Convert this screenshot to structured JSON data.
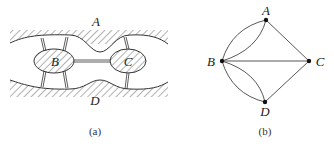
{
  "figure_a": {
    "caption": "(a)",
    "regions": {
      "top_bank": "A",
      "left_island": "B",
      "right_island": "C",
      "bottom_bank": "D"
    },
    "bridges": [
      {
        "from": "A",
        "to": "B",
        "count": 2
      },
      {
        "from": "D",
        "to": "B",
        "count": 2
      },
      {
        "from": "B",
        "to": "C",
        "count": 1
      },
      {
        "from": "A",
        "to": "C",
        "count": 1
      },
      {
        "from": "D",
        "to": "C",
        "count": 1
      }
    ]
  },
  "figure_b": {
    "caption": "(b)",
    "nodes": [
      {
        "id": "A",
        "label": "A"
      },
      {
        "id": "B",
        "label": "B"
      },
      {
        "id": "C",
        "label": "C"
      },
      {
        "id": "D",
        "label": "D"
      }
    ],
    "edges": [
      {
        "from": "B",
        "to": "A",
        "count": 2
      },
      {
        "from": "B",
        "to": "D",
        "count": 2
      },
      {
        "from": "B",
        "to": "C",
        "count": 1
      },
      {
        "from": "A",
        "to": "C",
        "count": 1
      },
      {
        "from": "D",
        "to": "C",
        "count": 1
      }
    ]
  },
  "colors": {
    "line": "#333333",
    "hatch": "#555555",
    "background": "#ffffff"
  }
}
